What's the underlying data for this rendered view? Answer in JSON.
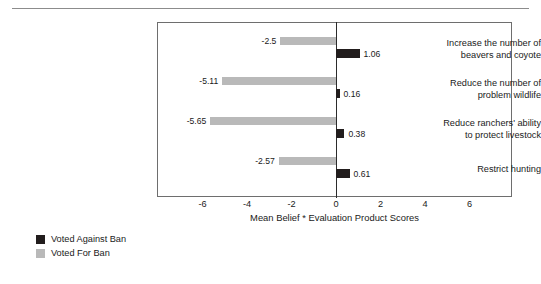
{
  "chart_data": {
    "type": "bar",
    "orientation": "horizontal",
    "title": "",
    "xlabel": "Mean Belief * Evaluation Product Scores",
    "ylabel": "",
    "xlim": [
      -7,
      7
    ],
    "xticks": [
      -6,
      -4,
      -2,
      0,
      2,
      4,
      6
    ],
    "xtick_labels": [
      "-6",
      "-4",
      "-2",
      "0",
      "2",
      "4",
      "6"
    ],
    "grid": false,
    "legend_position": "below-left",
    "categories": [
      "Increase the number of beavers and coyote",
      "Reduce the number of problem wildlife",
      "Reduce ranchers' ability to protect livestock",
      "Restrict hunting"
    ],
    "category_lines": [
      [
        "Increase the number of",
        "beavers and coyote"
      ],
      [
        "Reduce the number of",
        "problem wildlife"
      ],
      [
        "Reduce ranchers' ability",
        "to protect livestock"
      ],
      [
        "Restrict hunting"
      ]
    ],
    "series": [
      {
        "name": "Voted Against Ban",
        "color": "#221d1d",
        "values": [
          1.06,
          0.16,
          0.38,
          0.61
        ],
        "value_labels": [
          "1.06",
          "0.16",
          "0.38",
          "0.61"
        ]
      },
      {
        "name": "Voted For Ban",
        "color": "#b9b9b9",
        "values": [
          -2.5,
          -5.11,
          -5.65,
          -2.57
        ],
        "value_labels": [
          "-2.5",
          "-5.11",
          "-5.65",
          "-2.57"
        ]
      }
    ]
  },
  "legend": {
    "items": [
      {
        "label": "Voted Against Ban",
        "color": "#221d1d"
      },
      {
        "label": "Voted For Ban",
        "color": "#b9b9b9"
      }
    ]
  }
}
